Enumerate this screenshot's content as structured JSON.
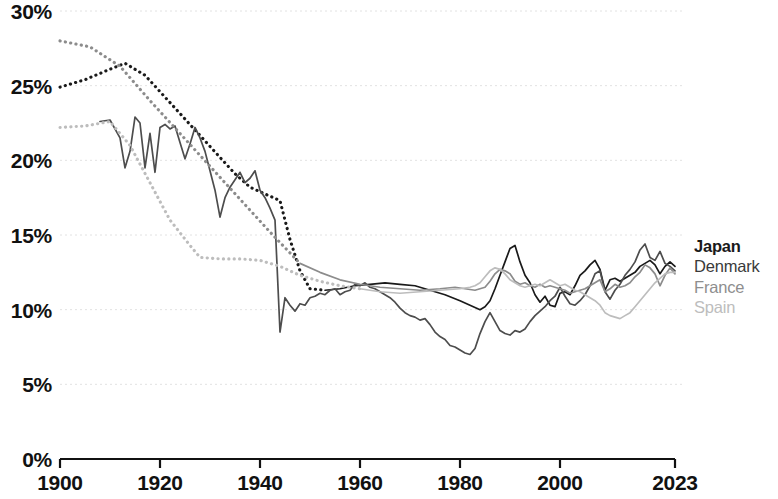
{
  "chart_data": {
    "type": "line",
    "title": "",
    "subtitle": "",
    "xlabel": "",
    "ylabel": "",
    "xlim": [
      1900,
      2023
    ],
    "ylim": [
      0,
      30
    ],
    "grid": true,
    "y_tick_suffix": "%",
    "y_ticks": [
      0,
      5,
      10,
      15,
      20,
      25,
      30
    ],
    "y_tick_labels": [
      "0%",
      "5%",
      "10%",
      "15%",
      "20%",
      "25%",
      "30%"
    ],
    "x_ticks": [
      1900,
      1920,
      1940,
      1960,
      1980,
      2000,
      2023
    ],
    "x_tick_labels": [
      "1900",
      "1920",
      "1940",
      "1960",
      "1980",
      "2000",
      "2023"
    ],
    "legend_position": "right",
    "series": [
      {
        "name": "Japan",
        "color": "#1a1a1a",
        "dash_until": 1955,
        "x": [
          1900,
          1905,
          1910,
          1913,
          1917,
          1920,
          1923,
          1926,
          1929,
          1932,
          1935,
          1938,
          1940,
          1942,
          1944,
          1946,
          1948,
          1950,
          1953,
          1956,
          1959,
          1962,
          1965,
          1968,
          1971,
          1974,
          1977,
          1980,
          1982,
          1984,
          1985,
          1986,
          1987,
          1988,
          1989,
          1990,
          1991,
          1992,
          1993,
          1994,
          1995,
          1996,
          1997,
          1998,
          1999,
          2000,
          2001,
          2002,
          2003,
          2004,
          2005,
          2006,
          2007,
          2008,
          2009,
          2010,
          2011,
          2012,
          2013,
          2014,
          2015,
          2016,
          2017,
          2018,
          2019,
          2020,
          2021,
          2022,
          2023
        ],
        "y": [
          24.9,
          25.4,
          26.1,
          26.5,
          25.7,
          24.6,
          23.5,
          22.4,
          21.3,
          20.2,
          19.1,
          18.2,
          17.9,
          17.6,
          17.3,
          14.7,
          12.6,
          11.4,
          11.3,
          11.4,
          11.6,
          11.7,
          11.8,
          11.7,
          11.6,
          11.3,
          11.0,
          10.6,
          10.3,
          10.0,
          10.2,
          10.6,
          11.4,
          12.3,
          13.2,
          14.1,
          14.3,
          13.2,
          12.3,
          11.8,
          11.0,
          10.5,
          10.9,
          10.3,
          10.2,
          11.1,
          11.2,
          11.0,
          11.6,
          12.3,
          12.6,
          13.0,
          13.3,
          12.7,
          11.3,
          12.0,
          12.1,
          11.9,
          12.1,
          12.3,
          12.5,
          12.9,
          13.1,
          13.3,
          13.0,
          12.4,
          12.9,
          13.2,
          12.9
        ]
      },
      {
        "name": "Denmark",
        "color": "#4d4d4d",
        "dash_until": 1900,
        "x": [
          1908,
          1910,
          1912,
          1913,
          1914,
          1915,
          1916,
          1917,
          1918,
          1919,
          1920,
          1921,
          1922,
          1923,
          1924,
          1925,
          1926,
          1927,
          1928,
          1929,
          1930,
          1931,
          1932,
          1933,
          1934,
          1935,
          1936,
          1937,
          1938,
          1939,
          1940,
          1941,
          1942,
          1943,
          1944,
          1945,
          1946,
          1947,
          1948,
          1949,
          1950,
          1951,
          1952,
          1953,
          1954,
          1955,
          1956,
          1957,
          1958,
          1959,
          1960,
          1961,
          1962,
          1963,
          1964,
          1965,
          1966,
          1967,
          1968,
          1969,
          1970,
          1971,
          1972,
          1973,
          1974,
          1975,
          1976,
          1977,
          1978,
          1979,
          1980,
          1981,
          1982,
          1983,
          1984,
          1985,
          1986,
          1987,
          1988,
          1989,
          1990,
          1991,
          1992,
          1993,
          1994,
          1995,
          1996,
          1997,
          1998,
          1999,
          2000,
          2001,
          2002,
          2003,
          2004,
          2005,
          2006,
          2007,
          2008,
          2009,
          2010,
          2011,
          2012,
          2013,
          2014,
          2015,
          2016,
          2017,
          2018,
          2019,
          2020,
          2021,
          2022,
          2023
        ],
        "y": [
          22.6,
          22.7,
          21.5,
          19.5,
          20.6,
          22.9,
          22.5,
          19.5,
          21.8,
          19.2,
          22.2,
          22.4,
          22.1,
          22.3,
          21.2,
          20.1,
          21.1,
          22.2,
          21.5,
          20.6,
          19.3,
          18.0,
          16.2,
          17.5,
          18.2,
          18.7,
          19.2,
          18.5,
          18.8,
          19.3,
          18.0,
          17.5,
          16.8,
          16.0,
          8.5,
          10.8,
          10.3,
          9.9,
          10.4,
          10.3,
          10.8,
          10.9,
          11.1,
          11.0,
          11.3,
          11.4,
          11.0,
          11.2,
          11.3,
          11.7,
          11.6,
          11.8,
          11.5,
          11.4,
          11.2,
          11.0,
          10.8,
          10.5,
          10.1,
          9.8,
          9.6,
          9.5,
          9.3,
          9.4,
          9.0,
          8.5,
          8.2,
          8.0,
          7.6,
          7.5,
          7.3,
          7.1,
          7.0,
          7.4,
          8.4,
          9.2,
          9.8,
          9.2,
          8.6,
          8.4,
          8.3,
          8.6,
          8.5,
          8.7,
          9.2,
          9.6,
          9.9,
          10.2,
          10.6,
          10.9,
          11.5,
          10.9,
          10.4,
          10.3,
          10.6,
          11.0,
          11.6,
          12.4,
          12.6,
          11.2,
          10.7,
          11.3,
          11.7,
          12.3,
          12.7,
          13.2,
          14.0,
          14.4,
          13.5,
          13.3,
          13.9,
          13.1,
          12.9,
          12.6
        ]
      },
      {
        "name": "France",
        "color": "#8c8c8c",
        "dash_until": 1949,
        "x": [
          1900,
          1906,
          1912,
          1918,
          1924,
          1930,
          1936,
          1942,
          1948,
          1952,
          1956,
          1960,
          1964,
          1968,
          1972,
          1976,
          1979,
          1981,
          1983,
          1985,
          1986,
          1987,
          1988,
          1989,
          1990,
          1991,
          1992,
          1993,
          1994,
          1995,
          1996,
          1997,
          1998,
          1999,
          2000,
          2001,
          2002,
          2003,
          2004,
          2005,
          2006,
          2007,
          2008,
          2009,
          2010,
          2011,
          2012,
          2013,
          2014,
          2015,
          2016,
          2017,
          2018,
          2019,
          2020,
          2021,
          2022,
          2023
        ],
        "y": [
          28.0,
          27.6,
          26.3,
          24.0,
          21.8,
          19.6,
          17.4,
          15.2,
          13.1,
          12.5,
          12.0,
          11.7,
          11.5,
          11.4,
          11.3,
          11.4,
          11.5,
          11.4,
          11.3,
          11.5,
          11.9,
          12.4,
          12.7,
          12.6,
          12.4,
          11.9,
          11.7,
          11.8,
          11.6,
          11.5,
          11.7,
          11.5,
          11.6,
          11.5,
          11.4,
          11.3,
          11.1,
          11.2,
          11.3,
          11.4,
          11.6,
          11.8,
          12.0,
          11.2,
          11.4,
          11.7,
          11.5,
          11.6,
          11.8,
          12.2,
          12.5,
          13.0,
          12.8,
          12.4,
          11.6,
          12.3,
          12.8,
          12.4
        ]
      },
      {
        "name": "Spain",
        "color": "#bdbdbd",
        "dash_until": 1960,
        "x": [
          1900,
          1905,
          1910,
          1914,
          1918,
          1922,
          1926,
          1928,
          1932,
          1936,
          1940,
          1944,
          1948,
          1952,
          1956,
          1960,
          1964,
          1968,
          1972,
          1976,
          1980,
          1982,
          1983,
          1984,
          1985,
          1986,
          1987,
          1988,
          1989,
          1990,
          1991,
          1992,
          1993,
          1994,
          1995,
          1996,
          1997,
          1998,
          1999,
          2000,
          2001,
          2002,
          2003,
          2004,
          2005,
          2006,
          2007,
          2008,
          2009,
          2010,
          2011,
          2012,
          2013,
          2014,
          2015,
          2016,
          2017,
          2018,
          2019,
          2020,
          2021,
          2022,
          2023
        ],
        "y": [
          22.2,
          22.3,
          22.6,
          21.0,
          18.5,
          16.0,
          14.3,
          13.5,
          13.4,
          13.4,
          13.3,
          12.9,
          12.3,
          11.9,
          11.6,
          11.4,
          11.2,
          11.1,
          11.2,
          11.3,
          11.4,
          11.5,
          11.6,
          11.8,
          12.2,
          12.6,
          12.8,
          12.7,
          12.4,
          12.0,
          11.8,
          11.6,
          11.5,
          11.6,
          11.7,
          11.6,
          11.8,
          12.0,
          11.8,
          11.6,
          11.7,
          11.5,
          11.3,
          11.2,
          11.0,
          10.8,
          10.6,
          10.3,
          9.8,
          9.6,
          9.5,
          9.4,
          9.6,
          9.8,
          10.2,
          10.6,
          11.0,
          11.4,
          11.8,
          12.1,
          12.4,
          12.5,
          12.5
        ]
      }
    ]
  },
  "legend": {
    "entries": [
      {
        "label": "Japan"
      },
      {
        "label": "Denmark"
      },
      {
        "label": "France"
      },
      {
        "label": "Spain"
      }
    ]
  },
  "axes": {
    "y_labels": [
      "30%",
      "25%",
      "20%",
      "15%",
      "10%",
      "5%",
      "0%"
    ],
    "x_labels": [
      "1900",
      "1920",
      "1940",
      "1960",
      "1980",
      "2000",
      "2023"
    ]
  }
}
